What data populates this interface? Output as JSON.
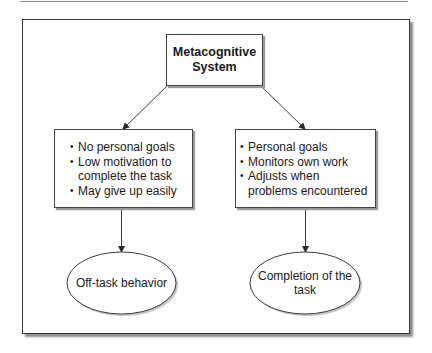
{
  "diagram": {
    "type": "flowchart",
    "root": {
      "label": "Metacognitive\nSystem"
    },
    "branches": [
      {
        "id": "left",
        "items": [
          "No personal goals",
          "Low motivation to complete the task",
          "May give up easily"
        ],
        "item_lines": [
          [
            "No personal goals"
          ],
          [
            "Low motivation to",
            "complete the task"
          ],
          [
            "May give up easily"
          ]
        ],
        "outcome": "Off-task behavior"
      },
      {
        "id": "right",
        "items": [
          "Personal goals",
          "Monitors own work",
          "Adjusts when problems encountered"
        ],
        "item_lines": [
          [
            "Personal goals"
          ],
          [
            "Monitors own work"
          ],
          [
            "Adjusts when",
            "problems encountered"
          ]
        ],
        "outcome": "Completion of the\ntask"
      }
    ],
    "edges": [
      {
        "from": "Metacognitive System",
        "to": "left-list"
      },
      {
        "from": "Metacognitive System",
        "to": "right-list"
      },
      {
        "from": "left-list",
        "to": "Off-task behavior"
      },
      {
        "from": "right-list",
        "to": "Completion of the task"
      }
    ]
  },
  "colors": {
    "stroke": "#3a3a3a",
    "shadow": "#8c8c8c",
    "background": "#ffffff"
  },
  "text": {
    "root_label": "Metacognitive\nSystem",
    "left_items": {
      "0": "No personal goals",
      "1": "Low motivation to\ncomplete the task",
      "2": "May give up easily"
    },
    "right_items": {
      "0": "Personal goals",
      "1": "Monitors own work",
      "2": "Adjusts when\nproblems encountered"
    },
    "left_outcome": "Off-task behavior",
    "right_outcome": "Completion of the\ntask"
  }
}
